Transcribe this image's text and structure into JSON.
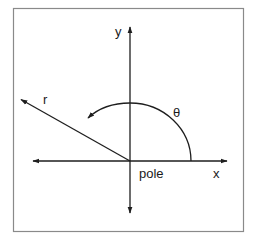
{
  "diagram": {
    "type": "polar-coordinates",
    "colors": {
      "background": "#ffffff",
      "border": "#8a8a8a",
      "stroke": "#1e1e1e",
      "text": "#1a1a1a"
    },
    "labels": {
      "y_axis": "y",
      "x_axis": "x",
      "radius": "r",
      "angle": "θ",
      "origin": "pole"
    }
  }
}
